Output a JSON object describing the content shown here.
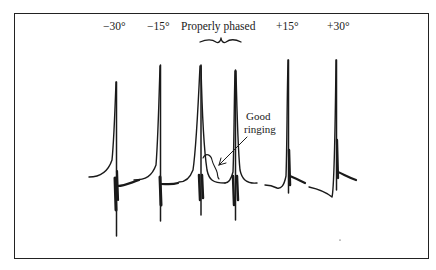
{
  "figure": {
    "phase_labels": [
      {
        "id": "minus30",
        "text": "−30°"
      },
      {
        "id": "minus15",
        "text": "−15°"
      },
      {
        "id": "proper",
        "text": "Properly phased"
      },
      {
        "id": "plus15",
        "text": "+15°"
      },
      {
        "id": "plus30",
        "text": "+30°"
      }
    ],
    "annotation": {
      "line1": "Good",
      "line2": "ringing"
    },
    "colors": {
      "ink": "#1a1a1a",
      "background": "#ffffff"
    }
  }
}
